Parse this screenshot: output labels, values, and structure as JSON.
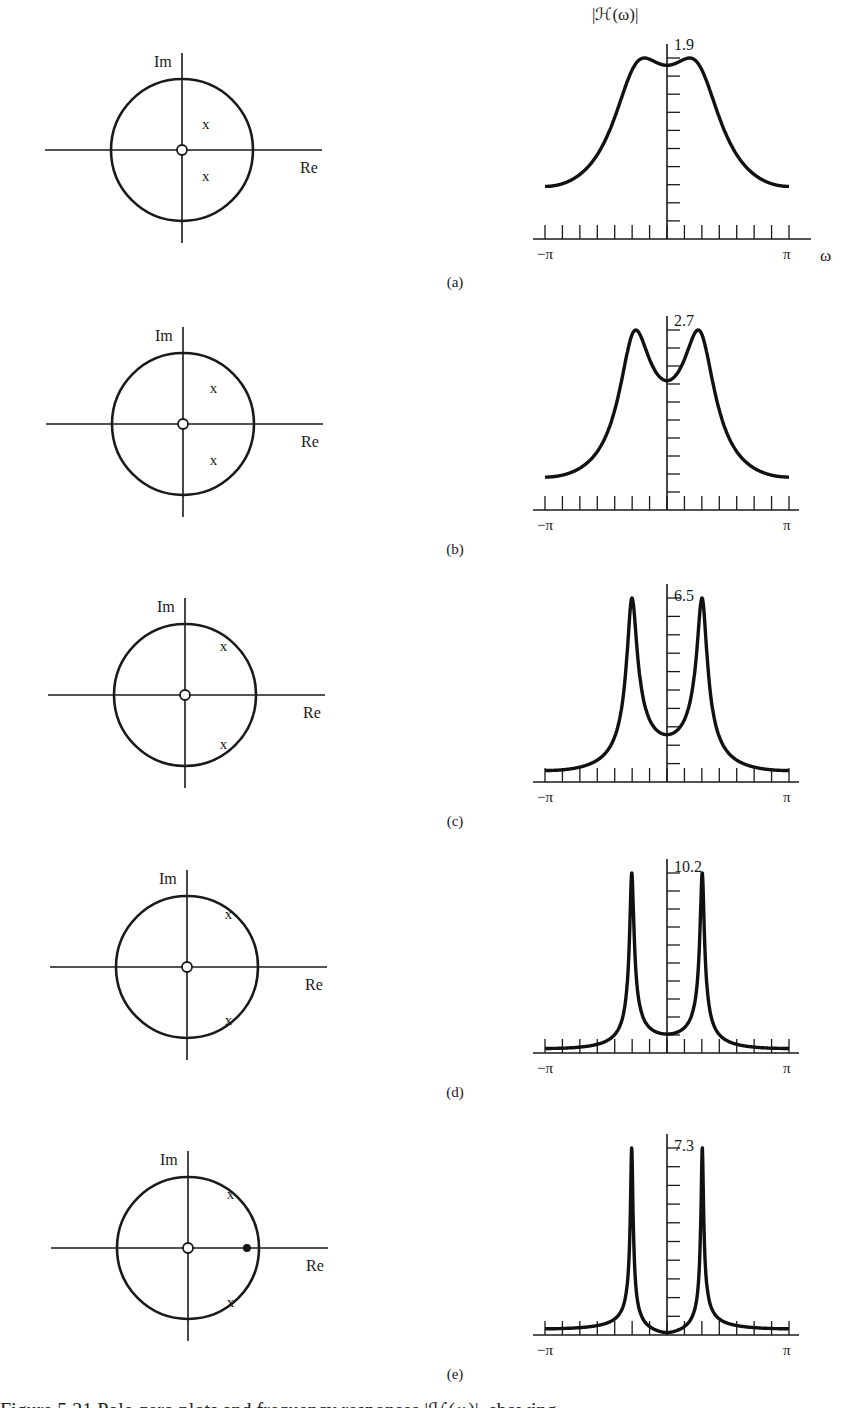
{
  "figure": {
    "panels": [
      {
        "id": "a",
        "caption": "(a)",
        "peak_label": "1.9",
        "y_axis_label": "|ℋ(ω)|",
        "x_axis_label": "ω",
        "x_min_label": "−π",
        "x_max_label": "π",
        "pz": {
          "zeros": [
            [
              0,
              0
            ]
          ],
          "poles_polar": [
            {
              "r": 0.5,
              "theta_deg": 48
            },
            {
              "r": 0.5,
              "theta_deg": -48
            }
          ],
          "extra_zeros_filled": []
        }
      },
      {
        "id": "b",
        "caption": "(b)",
        "peak_label": "2.7",
        "y_axis_label": "",
        "x_axis_label": "",
        "x_min_label": "−π",
        "x_max_label": "π",
        "pz": {
          "zeros": [
            [
              0,
              0
            ]
          ],
          "poles_polar": [
            {
              "r": 0.67,
              "theta_deg": 50
            },
            {
              "r": 0.67,
              "theta_deg": -50
            }
          ],
          "extra_zeros_filled": []
        }
      },
      {
        "id": "c",
        "caption": "(c)",
        "peak_label": "6.5",
        "y_axis_label": "",
        "x_axis_label": "",
        "x_min_label": "−π",
        "x_max_label": "π",
        "pz": {
          "zeros": [
            [
              0,
              0
            ]
          ],
          "poles_polar": [
            {
              "r": 0.88,
              "theta_deg": 52
            },
            {
              "r": 0.88,
              "theta_deg": -52
            }
          ],
          "extra_zeros_filled": []
        }
      },
      {
        "id": "d",
        "caption": "(d)",
        "peak_label": "10.2",
        "y_axis_label": "",
        "x_axis_label": "",
        "x_min_label": "−π",
        "x_max_label": "π",
        "pz": {
          "zeros": [
            [
              0,
              0
            ]
          ],
          "poles_polar": [
            {
              "r": 0.95,
              "theta_deg": 52
            },
            {
              "r": 0.95,
              "theta_deg": -52
            }
          ],
          "extra_zeros_filled": []
        }
      },
      {
        "id": "e",
        "caption": "(e)",
        "peak_label": "7.3",
        "y_axis_label": "",
        "x_axis_label": "",
        "x_min_label": "−π",
        "x_max_label": "π",
        "pz": {
          "zeros": [
            [
              0,
              0
            ]
          ],
          "poles_polar": [
            {
              "r": 0.97,
              "theta_deg": 52
            },
            {
              "r": 0.97,
              "theta_deg": -52
            }
          ],
          "extra_zeros_filled": [
            [
              0.83,
              0
            ]
          ]
        }
      }
    ],
    "pz_axis_labels": {
      "im": "Im",
      "re": "Re"
    },
    "truncated_caption_line": "Figure 5.21  Pole-zero plots and frequency responses  |ℋ(ω)|, showing ..."
  },
  "chart_data": [
    {
      "type": "line",
      "title": "(a)",
      "xlabel": "ω",
      "ylabel": "|ℋ(ω)|",
      "x": [
        -3.14,
        -2.5,
        -2.0,
        -1.5,
        -1.0,
        -0.5,
        -0.2,
        0,
        0.2,
        0.5,
        1.0,
        1.5,
        2.0,
        2.5,
        3.14
      ],
      "values": [
        0.53,
        0.62,
        0.76,
        0.98,
        1.33,
        1.75,
        1.9,
        1.86,
        1.9,
        1.75,
        1.33,
        0.98,
        0.76,
        0.62,
        0.53
      ],
      "peak": 1.9,
      "xlim": [
        -3.14,
        3.14
      ],
      "x_ticks": 15,
      "y_ticks": 10
    },
    {
      "type": "line",
      "title": "(b)",
      "xlabel": "ω",
      "ylabel": "|ℋ(ω)|",
      "x": [
        -3.14,
        -2.5,
        -2.0,
        -1.5,
        -1.2,
        -0.9,
        -0.6,
        0,
        0.6,
        0.9,
        1.2,
        1.5,
        2.0,
        2.5,
        3.14
      ],
      "values": [
        0.38,
        0.48,
        0.67,
        1.1,
        1.7,
        2.7,
        2.3,
        2.0,
        2.3,
        2.7,
        1.7,
        1.1,
        0.67,
        0.48,
        0.38
      ],
      "peak": 2.7,
      "xlim": [
        -3.14,
        3.14
      ],
      "x_ticks": 15,
      "y_ticks": 10
    },
    {
      "type": "line",
      "title": "(c)",
      "xlabel": "ω",
      "ylabel": "|ℋ(ω)|",
      "x": [
        -3.14,
        -2.5,
        -2.0,
        -1.5,
        -1.2,
        -0.9,
        -0.6,
        0,
        0.6,
        0.9,
        1.2,
        1.5,
        2.0,
        2.5,
        3.14
      ],
      "values": [
        0.25,
        0.4,
        0.7,
        1.6,
        3.5,
        6.5,
        3.0,
        1.9,
        3.0,
        6.5,
        3.5,
        1.6,
        0.7,
        0.4,
        0.25
      ],
      "peak": 6.5,
      "xlim": [
        -3.14,
        3.14
      ],
      "x_ticks": 15,
      "y_ticks": 10
    },
    {
      "type": "line",
      "title": "(d)",
      "xlabel": "ω",
      "ylabel": "|ℋ(ω)|",
      "x": [
        -3.14,
        -2.5,
        -2.0,
        -1.5,
        -1.2,
        -0.9,
        -0.6,
        0,
        0.6,
        0.9,
        1.2,
        1.5,
        2.0,
        2.5,
        3.14
      ],
      "values": [
        0.2,
        0.35,
        0.6,
        1.3,
        3.2,
        10.2,
        3.2,
        1.8,
        3.2,
        10.2,
        3.2,
        1.3,
        0.6,
        0.35,
        0.2
      ],
      "peak": 10.2,
      "xlim": [
        -3.14,
        3.14
      ],
      "x_ticks": 15,
      "y_ticks": 10
    },
    {
      "type": "line",
      "title": "(e)",
      "xlabel": "ω",
      "ylabel": "|ℋ(ω)|",
      "x": [
        -3.14,
        -2.5,
        -2.0,
        -1.5,
        -1.2,
        -0.9,
        -0.6,
        0,
        0.6,
        0.9,
        1.2,
        1.5,
        2.0,
        2.5,
        3.14
      ],
      "values": [
        0.35,
        0.5,
        0.8,
        1.6,
        3.3,
        7.3,
        2.6,
        0.45,
        2.6,
        7.3,
        3.3,
        1.6,
        0.8,
        0.5,
        0.35
      ],
      "peak": 7.3,
      "xlim": [
        -3.14,
        3.14
      ],
      "x_ticks": 15,
      "y_ticks": 10
    }
  ]
}
